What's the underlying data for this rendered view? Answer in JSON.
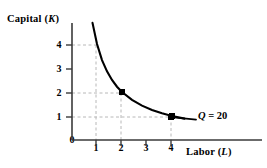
{
  "figure": {
    "background_color": "#ffffff",
    "ink_color": "#000000",
    "grid_color": "#b8b8b8"
  },
  "axes": {
    "y_title_prefix": "Capital (",
    "y_title_symbol": "K",
    "y_title_suffix": ")",
    "x_title_prefix": "Labor (",
    "x_title_symbol": "L",
    "x_title_suffix": ")",
    "origin_label": "0",
    "x_ticks": [
      "1",
      "2",
      "3",
      "4"
    ],
    "y_ticks": [
      "1",
      "2",
      "3",
      "4"
    ]
  },
  "annotations": {
    "isoquant_label_symbol": "Q",
    "isoquant_label_value": " = 20"
  },
  "chart_data": {
    "type": "line",
    "title": "",
    "subtitle": "",
    "xlabel": "Labor (L)",
    "ylabel": "Capital (K)",
    "xlim": [
      0,
      5
    ],
    "ylim": [
      0,
      5
    ],
    "xticks": [
      1,
      2,
      3,
      4
    ],
    "yticks": [
      1,
      2,
      3,
      4
    ],
    "grid": "dashed-guides-to-marked-points",
    "legend": "inline-curve-label",
    "series": [
      {
        "name": "Q = 20",
        "relation": "L * K = 4",
        "x": [
          0.82,
          1.0,
          1.2,
          1.4,
          1.6,
          1.8,
          2.0,
          2.4,
          2.8,
          3.2,
          3.6,
          4.0,
          4.5
        ],
        "y": [
          4.88,
          4.0,
          3.33,
          2.86,
          2.5,
          2.22,
          2.0,
          1.67,
          1.43,
          1.25,
          1.11,
          1.0,
          0.89
        ]
      }
    ],
    "marked_points": [
      {
        "x": 1,
        "y": 4,
        "label": ""
      },
      {
        "x": 2,
        "y": 2,
        "label": ""
      },
      {
        "x": 4,
        "y": 1,
        "label": ""
      }
    ],
    "annotations": [
      {
        "text": "Q = 20",
        "x": 4.6,
        "y": 1.0,
        "leader_line": true
      }
    ]
  }
}
